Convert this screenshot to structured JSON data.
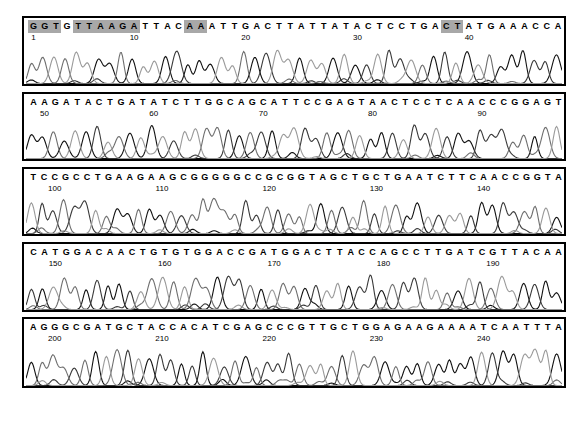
{
  "figure": {
    "type": "dna-sequencing-chromatogram",
    "panel_count": 5,
    "trace_colors": [
      "#111111",
      "#3a3a3a",
      "#6e6e6e",
      "#9a9a9a"
    ],
    "highlight_color": "#a8a8a8",
    "border_color": "#000000",
    "background": "#ffffff"
  },
  "panels": [
    {
      "name": "panel-1",
      "sequence": "GGTGTTAAGATTACAAATTGACTTATTATACTCCTGACTATGAAACCA",
      "start_position": 1,
      "highlights": [
        [
          0,
          2
        ],
        [
          4,
          9
        ],
        [
          14,
          15
        ],
        [
          37,
          38
        ]
      ],
      "ticks": [
        {
          "label": "1",
          "index": 0
        },
        {
          "label": "10",
          "index": 9
        },
        {
          "label": "20",
          "index": 19
        },
        {
          "label": "30",
          "index": 29
        },
        {
          "label": "40",
          "index": 39
        }
      ]
    },
    {
      "name": "panel-2",
      "sequence": "AAGATACTGATATCTTGGCAGCATTCCGAGTAACTCCTCAACCCGGAGT",
      "start_position": 49,
      "highlights": [],
      "ticks": [
        {
          "label": "50",
          "index": 1
        },
        {
          "label": "60",
          "index": 11
        },
        {
          "label": "70",
          "index": 21
        },
        {
          "label": "80",
          "index": 31
        },
        {
          "label": "90",
          "index": 41
        }
      ]
    },
    {
      "name": "panel-3",
      "sequence": "TCCGCCTGAAGAAGCGGGGGCCGCGGTAGCTGCTGAATCTTCAACCGGTA",
      "start_position": 98,
      "highlights": [],
      "ticks": [
        {
          "label": "100",
          "index": 2
        },
        {
          "label": "110",
          "index": 12
        },
        {
          "label": "120",
          "index": 22
        },
        {
          "label": "130",
          "index": 32
        },
        {
          "label": "140",
          "index": 42
        }
      ]
    },
    {
      "name": "panel-4",
      "sequence": "CATGGACAACTGTGTGGACCGATGGACTTACCAGCCTTGATCGTTACAA",
      "start_position": 148,
      "highlights": [],
      "ticks": [
        {
          "label": "150",
          "index": 2
        },
        {
          "label": "160",
          "index": 12
        },
        {
          "label": "170",
          "index": 22
        },
        {
          "label": "180",
          "index": 32
        },
        {
          "label": "190",
          "index": 42
        }
      ]
    },
    {
      "name": "panel-5",
      "sequence": "AGGGCGATGCTACCACATCGAGCCCGTTGCTGGAGAAGAAAATCAATTTA",
      "start_position": 198,
      "highlights": [],
      "ticks": [
        {
          "label": "200",
          "index": 2
        },
        {
          "label": "210",
          "index": 12
        },
        {
          "label": "220",
          "index": 22
        },
        {
          "label": "230",
          "index": 32
        },
        {
          "label": "240",
          "index": 42
        }
      ]
    }
  ]
}
